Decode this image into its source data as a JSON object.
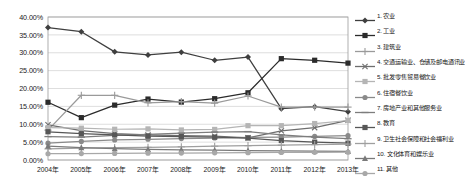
{
  "chart_data": {
    "type": "line",
    "title": "",
    "xlabel": "",
    "ylabel": "",
    "ylim": [
      0,
      0.4
    ],
    "ytick_labels": [
      "40.00%",
      "35.00%",
      "30.00%",
      "25.00%",
      "20.00%",
      "15.00%",
      "10.00%",
      "5.00%",
      "0.00%"
    ],
    "ytick_values": [
      0.4,
      0.35,
      0.3,
      0.25,
      0.2,
      0.15,
      0.1,
      0.05,
      0.0
    ],
    "grid": true,
    "legend_position": "right",
    "categories": [
      "2004年",
      "2005年",
      "2006年",
      "2007年",
      "2008年",
      "2009年",
      "2010年",
      "2011年",
      "2012年",
      "2013年"
    ],
    "series": [
      {
        "name": "1. 农业",
        "index": "1",
        "color": "#3f3f3f",
        "marker": "diamond",
        "values": [
          0.3705,
          0.359,
          0.3025,
          0.294,
          0.3015,
          0.279,
          0.288,
          0.1435,
          0.149,
          0.135
        ]
      },
      {
        "name": "2. 工业",
        "index": "2",
        "color": "#2b2b2b",
        "marker": "square",
        "values": [
          0.1615,
          0.1185,
          0.1535,
          0.1705,
          0.162,
          0.1715,
          0.188,
          0.2835,
          0.279,
          0.271
        ]
      },
      {
        "name": "3. 建筑业",
        "index": "3",
        "color": "#9a9a9a",
        "marker": "plus",
        "values": [
          0.0835,
          0.181,
          0.181,
          0.16,
          0.1635,
          0.159,
          0.179,
          0.148,
          0.148,
          0.148
        ]
      },
      {
        "name": "4. 交通运输业、仓储及邮电通讯业",
        "index": "4",
        "color": "#6e6e6e",
        "marker": "cross",
        "values": [
          0.0985,
          0.0825,
          0.074,
          0.07,
          0.068,
          0.0665,
          0.062,
          0.0815,
          0.0905,
          0.111
        ]
      },
      {
        "name": "5. 批发零售贸易餐饮业",
        "index": "5",
        "color": "#b5b5b5",
        "marker": "square",
        "values": [
          0.0905,
          0.089,
          0.086,
          0.087,
          0.084,
          0.0855,
          0.096,
          0.096,
          0.102,
          0.1105
        ]
      },
      {
        "name": "6. 住宿餐饮业",
        "index": "6",
        "color": "#8a8a8a",
        "marker": "circle",
        "values": [
          0.047,
          0.052,
          0.056,
          0.058,
          0.06,
          0.0615,
          0.063,
          0.064,
          0.066,
          0.068
        ]
      },
      {
        "name": "7. 房地产业和其他服务业",
        "index": "7",
        "color": "#7d7d7d",
        "marker": "line",
        "values": [
          0.0655,
          0.064,
          0.069,
          0.072,
          0.075,
          0.078,
          0.0795,
          0.0705,
          0.064,
          0.0595
        ]
      },
      {
        "name": "8. 教育",
        "index": "8",
        "color": "#575757",
        "marker": "square",
        "values": [
          0.079,
          0.0735,
          0.07,
          0.067,
          0.0655,
          0.064,
          0.0615,
          0.0545,
          0.05,
          0.047
        ]
      },
      {
        "name": "9. 卫生社会保障和社会福利业",
        "index": "9",
        "color": "#9f9f9f",
        "marker": "plus",
        "values": [
          0.031,
          0.033,
          0.0345,
          0.0355,
          0.037,
          0.0385,
          0.04,
          0.0415,
          0.043,
          0.0445
        ]
      },
      {
        "name": "10. 文化体育和娱乐业",
        "index": "10",
        "color": "#7a7a7a",
        "marker": "triangle",
        "values": [
          0.039,
          0.0345,
          0.032,
          0.03,
          0.0285,
          0.0275,
          0.0265,
          0.0255,
          0.0245,
          0.024
        ]
      },
      {
        "name": "11. 其他",
        "index": "11",
        "color": "#a8a8a8",
        "marker": "circle",
        "values": [
          0.0175,
          0.018,
          0.0185,
          0.019,
          0.0195,
          0.02,
          0.0205,
          0.021,
          0.0215,
          0.022
        ]
      }
    ]
  },
  "caption": ""
}
